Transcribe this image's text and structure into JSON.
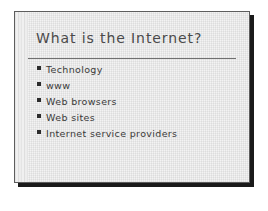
{
  "slide": {
    "title": "What is the Internet?",
    "bullets": [
      {
        "marker": "square-bullet-icon",
        "label": "Technology"
      },
      {
        "marker": "square-bullet-icon",
        "label": "www"
      },
      {
        "marker": "square-bullet-icon",
        "label": "Web browsers"
      },
      {
        "marker": "square-bullet-icon",
        "label": "Web sites"
      },
      {
        "marker": "square-bullet-icon",
        "label": "Internet service providers"
      }
    ],
    "colors": {
      "background": "#f3f3f3",
      "border": "#5d5d5d",
      "shadow": "#1a1a1a",
      "title_text": "#4a4a4a",
      "body_text": "#3a3a3a",
      "rule": "#6f6f6f",
      "bullet_marker": "#2b2b2b",
      "left_band": "#e4e4e4",
      "page": "#ffffff"
    }
  }
}
